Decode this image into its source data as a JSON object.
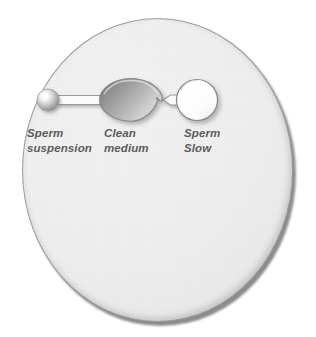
{
  "figure": {
    "kind": "petri-dish-sperm-selection-diagram",
    "background_color": "#ffffff",
    "dish": {
      "name": "petri-dish",
      "fill_color": "#eeeeee",
      "outline_color": "#9a9a9a",
      "shadow_color": "#8c8c8c",
      "center_x": 157,
      "center_y": 170,
      "width": 271,
      "height": 304
    }
  },
  "wells": [
    {
      "id": "sperm-suspension-well",
      "shape": "sphere",
      "center_x": 48,
      "center_y": 100,
      "radius": 11,
      "fill_color": "#bdbdbd",
      "highlight_color": "#ffffff"
    },
    {
      "id": "clean-medium-chamber",
      "shape": "lens",
      "center_x": 131,
      "center_y": 100,
      "width": 62,
      "height": 44,
      "fill_color": "#9d9d9d",
      "outline_color": "#8a8a8a"
    },
    {
      "id": "sperm-slow-well",
      "shape": "circle",
      "center_x": 197,
      "center_y": 100,
      "radius": 20,
      "fill_color": "#fdfdfd",
      "outline_color": "#8a8a8a"
    }
  ],
  "channels": [
    {
      "id": "channel-suspension-to-medium",
      "from": "sperm-suspension-well",
      "to": "clean-medium-chamber",
      "fill_color": "#fbfbfb",
      "outline_color": "#9a9a9a"
    },
    {
      "id": "channel-medium-to-slow",
      "from": "clean-medium-chamber",
      "to": "sperm-slow-well",
      "fill_color": "#fbfbfb",
      "outline_color": "#9a9a9a"
    }
  ],
  "labels": {
    "sperm_suspension": {
      "line1": "Sperm",
      "line2": "suspension"
    },
    "clean_medium": {
      "line1": "Clean",
      "line2": "medium"
    },
    "sperm_slow": {
      "line1": "Sperm",
      "line2": "Slow"
    },
    "text_color": "#5b5b5b"
  }
}
